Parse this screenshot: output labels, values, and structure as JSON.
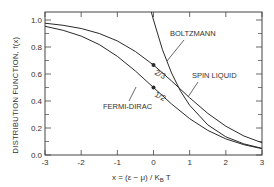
{
  "chart_data": {
    "type": "line",
    "title": "",
    "xlabel": "x = (ε − μ) / K_B T",
    "ylabel": "DISTRIBUTION FUNCTION, f(x)",
    "xlim": [
      -3,
      3
    ],
    "ylim": [
      0,
      1.05
    ],
    "xticks": [
      -3,
      -2,
      -1,
      0,
      1,
      2,
      3
    ],
    "xtick_labels": [
      "-3",
      "-2",
      "-1",
      "0",
      "1",
      "2",
      "3"
    ],
    "yticks": [
      0.0,
      0.2,
      0.4,
      0.6,
      0.8,
      1.0
    ],
    "ytick_labels": [
      "0.0",
      "0.2",
      "0.4",
      "0.6",
      "0.8",
      "1.0"
    ],
    "grid": false,
    "legend": "inline labels with leader arrows",
    "series": [
      {
        "name": "FERMI-DIRAC",
        "x": [
          -3,
          -2.5,
          -2,
          -1.5,
          -1,
          -0.5,
          0,
          0.5,
          1,
          1.5,
          2,
          2.5,
          3
        ],
        "values": [
          0.953,
          0.924,
          0.881,
          0.818,
          0.731,
          0.622,
          0.5,
          0.378,
          0.269,
          0.182,
          0.119,
          0.076,
          0.047
        ]
      },
      {
        "name": "SPIN LIQUID",
        "x": [
          -3,
          -2.5,
          -2,
          -1.5,
          -1,
          -0.5,
          0,
          0.5,
          1,
          1.5,
          2,
          2.5,
          3
        ],
        "values": [
          0.976,
          0.961,
          0.937,
          0.9,
          0.845,
          0.767,
          0.667,
          0.548,
          0.424,
          0.308,
          0.213,
          0.141,
          0.091
        ]
      },
      {
        "name": "BOLTZMANN",
        "x": [
          -0.06,
          0,
          0.25,
          0.5,
          0.75,
          1,
          1.5,
          2,
          2.5,
          3
        ],
        "values": [
          1.06,
          1.0,
          0.779,
          0.607,
          0.472,
          0.368,
          0.223,
          0.135,
          0.082,
          0.05
        ]
      }
    ],
    "annotations": [
      {
        "text": "1/2",
        "x": 0,
        "y": 0.5,
        "marker": "dot"
      },
      {
        "text": "2/3",
        "x": 0,
        "y": 0.667,
        "marker": "dot"
      },
      {
        "text": "BOLTZMANN"
      },
      {
        "text": "SPIN LIQUID"
      },
      {
        "text": "FERMI-DIRAC"
      }
    ]
  },
  "labels": {
    "boltzmann": "BOLTZMANN",
    "spin_liquid": "SPIN LIQUID",
    "fermi_dirac": "FERMI-DIRAC",
    "half": "1/2",
    "two_thirds": "2/3",
    "ylabel": "DISTRIBUTION FUNCTION, f(x)",
    "xlabel": "x = (ε − μ) / K",
    "xlabel_sub": "B",
    "xlabel_tail": " T"
  },
  "colors": {
    "line": "#2a2a2a",
    "axis": "#444444",
    "text": "#333333"
  }
}
